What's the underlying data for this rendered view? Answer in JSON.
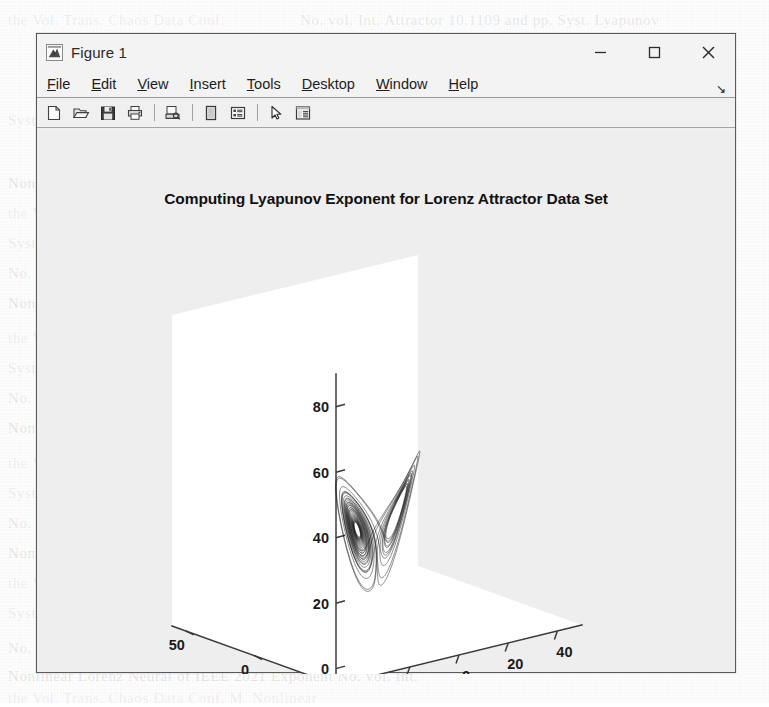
{
  "window": {
    "title": "Figure 1",
    "app_icon": "matlab-membrane-icon",
    "controls": {
      "minimize": "minimize-icon",
      "maximize": "maximize-icon",
      "close": "close-icon"
    }
  },
  "menu": {
    "items": [
      {
        "label": "File",
        "mnemonic": "F"
      },
      {
        "label": "Edit",
        "mnemonic": "E"
      },
      {
        "label": "View",
        "mnemonic": "V"
      },
      {
        "label": "Insert",
        "mnemonic": "I"
      },
      {
        "label": "Tools",
        "mnemonic": "T"
      },
      {
        "label": "Desktop",
        "mnemonic": "D"
      },
      {
        "label": "Window",
        "mnemonic": "W"
      },
      {
        "label": "Help",
        "mnemonic": "H"
      }
    ],
    "overflow_glyph": "↘"
  },
  "toolbar": {
    "buttons": [
      {
        "name": "new-figure-icon",
        "tooltip": "New Figure"
      },
      {
        "name": "open-file-icon",
        "tooltip": "Open File"
      },
      {
        "name": "save-figure-icon",
        "tooltip": "Save Figure"
      },
      {
        "name": "print-figure-icon",
        "tooltip": "Print Figure"
      },
      {
        "name": "sep"
      },
      {
        "name": "print-preview-icon",
        "tooltip": "Print Preview"
      },
      {
        "name": "sep"
      },
      {
        "name": "insert-colorbar-icon",
        "tooltip": "Insert Colorbar"
      },
      {
        "name": "insert-legend-icon",
        "tooltip": "Insert Legend"
      },
      {
        "name": "sep"
      },
      {
        "name": "edit-plot-pointer-icon",
        "tooltip": "Edit Plot"
      },
      {
        "name": "property-inspector-icon",
        "tooltip": "Open Property Inspector"
      }
    ]
  },
  "colors": {
    "window_border": "#5a5a5a",
    "figure_background": "#eeeeee",
    "axes_background": "#ffffff",
    "axes_line": "#3a3a3a",
    "data_line": "#1a1a1a",
    "page_background": "#fdfdfd"
  },
  "ghost_text": [
    {
      "x": 70,
      "y": 18,
      "text": "",
      "size": 15
    },
    {
      "x": 392,
      "y": 14,
      "text": "",
      "size": 15
    },
    {
      "x": 60,
      "y": 196,
      "text": "",
      "size": 15
    }
  ],
  "chart_data": {
    "type": "line",
    "render": "lorenz-attractor-3d",
    "title": "Computing Lyapunov Exponent for Lorenz Attractor Data Set",
    "xlabel": "",
    "ylabel": "",
    "zlabel": "",
    "grid": false,
    "legend": null,
    "projection": "3d-orthographic",
    "view": {
      "azimuth": -37.5,
      "elevation": 30
    },
    "axes": {
      "x": {
        "ticks": [
          -40,
          -20,
          0,
          20,
          40
        ],
        "lim": [
          -50,
          50
        ],
        "label": ""
      },
      "y": {
        "ticks": [
          50,
          0,
          -50
        ],
        "lim": [
          -60,
          60
        ],
        "label": ""
      },
      "z": {
        "ticks": [
          0,
          20,
          40,
          60,
          80
        ],
        "lim": [
          -5,
          90
        ],
        "label": ""
      }
    },
    "system": {
      "name": "Lorenz",
      "equations": [
        "dx/dt = sigma*(y - x)",
        "dy/dt = x*(rho - z) - y",
        "dz/dt = x*y - beta*z"
      ],
      "sigma": 10,
      "rho": 28,
      "beta": 2.6667,
      "initial_condition": [
        1,
        1,
        1
      ],
      "dt": 0.006,
      "steps": 5200
    }
  }
}
